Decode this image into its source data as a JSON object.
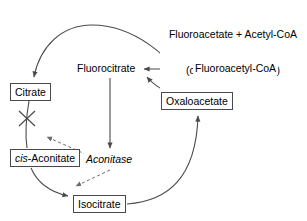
{
  "diagram": {
    "nodes": {
      "fluoroacetate_input_line1": "Fluoroacetate + Acetyl-CoA",
      "fluoroacetate_input_line2": "(or fluoroacetamide)",
      "fluoroacetyl_coa": "Fluoroacetyl-CoA",
      "fluorocitrate": "Fluorocitrate",
      "oxaloacetate": "Oxaloacetate",
      "citrate": "Citrate",
      "cis_aconitate_prefix": "cis",
      "cis_aconitate_rest": "-Aconitate",
      "isocitrate": "Isocitrate",
      "aconitase": "Aconitase"
    },
    "colors": {
      "stroke": "#4a4a4a",
      "text": "#000000",
      "background": "#ffffff"
    },
    "edges": [
      {
        "name": "fluoroacetate-to-fluoroacetylcoa",
        "style": "solid",
        "from": "fluoroacetate_input",
        "to": "fluoroacetyl_coa"
      },
      {
        "name": "fluoroacetylcoa-to-fluorocitrate",
        "style": "solid",
        "from": "fluoroacetyl_coa",
        "to": "fluorocitrate"
      },
      {
        "name": "oxaloacetate-to-fluorocitrate",
        "style": "solid",
        "from": "oxaloacetate",
        "to": "fluorocitrate"
      },
      {
        "name": "fluorocitrate-to-aconitase",
        "style": "solid",
        "from": "fluorocitrate",
        "to": "aconitase"
      },
      {
        "name": "oxaloacetate-to-citrate",
        "style": "solid",
        "from": "oxaloacetate",
        "to": "citrate"
      },
      {
        "name": "citrate-to-cis-aconitate-blocked",
        "style": "solid-blocked",
        "from": "citrate",
        "to": "cis_aconitate"
      },
      {
        "name": "cis-aconitate-to-isocitrate",
        "style": "solid",
        "from": "cis_aconitate",
        "to": "isocitrate"
      },
      {
        "name": "isocitrate-to-oxaloacetate",
        "style": "solid",
        "from": "isocitrate",
        "to": "oxaloacetate"
      },
      {
        "name": "aconitase-to-citrate-step",
        "style": "dashed",
        "from": "aconitase",
        "to": "citrate_block"
      },
      {
        "name": "aconitase-to-isocitrate-step",
        "style": "dashed",
        "from": "aconitase",
        "to": "isocitrate_step"
      }
    ],
    "block_marker": "X"
  }
}
